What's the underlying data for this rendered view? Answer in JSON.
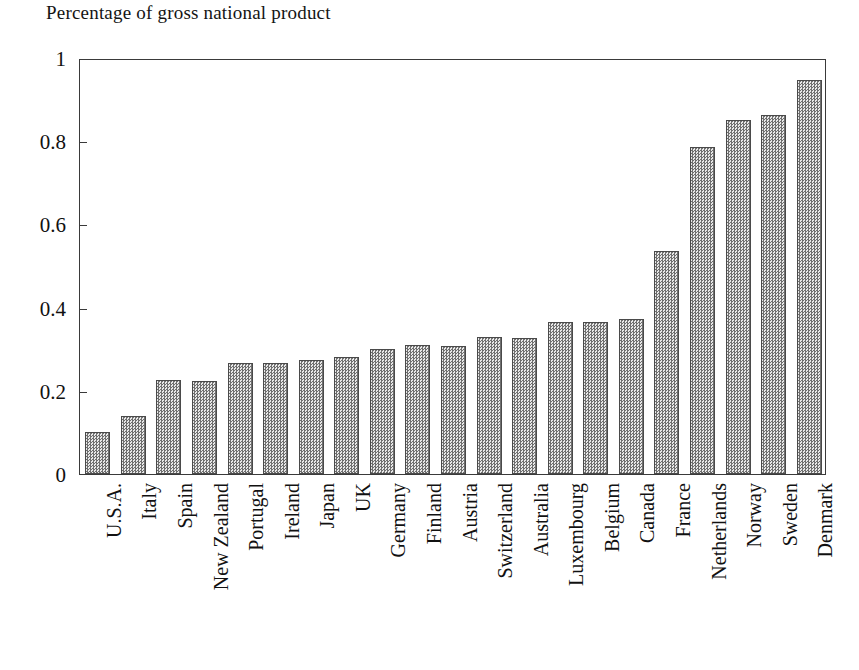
{
  "chart_data": {
    "type": "bar",
    "title": "Percentage of gross national product",
    "xlabel": "",
    "ylabel": "",
    "ylim": [
      0,
      1
    ],
    "yticks": [
      0,
      0.2,
      0.4,
      0.6,
      0.8,
      1
    ],
    "ytick_labels": [
      "0",
      "0.2",
      "0.4",
      "0.6",
      "0.8",
      "1"
    ],
    "grid": false,
    "legend": null,
    "bar_fill": "#a8a8a8",
    "bar_edge": "#4a4a4a",
    "categories": [
      "U.S.A.",
      "Italy",
      "Spain",
      "New Zealand",
      "Portugal",
      "Ireland",
      "Japan",
      "UK",
      "Germany",
      "Finland",
      "Austria",
      "Switzerland",
      "Australia",
      "Luxembourg",
      "Belgium",
      "Canada",
      "France",
      "Netherlands",
      "Norway",
      "Sweden",
      "Denmark"
    ],
    "values": [
      0.1,
      0.14,
      0.225,
      0.223,
      0.268,
      0.266,
      0.274,
      0.281,
      0.3,
      0.31,
      0.308,
      0.33,
      0.327,
      0.365,
      0.365,
      0.372,
      0.535,
      0.785,
      0.852,
      0.864,
      0.948
    ]
  }
}
